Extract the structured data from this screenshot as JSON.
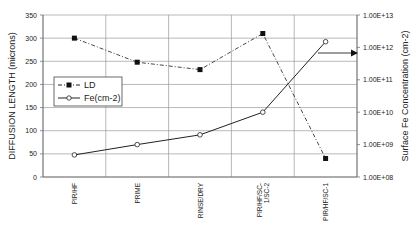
{
  "chart_data": {
    "type": "line",
    "title": "",
    "categories": [
      "PIR/HF",
      "PRIME",
      "RINSE/DRY",
      "PIR/HF/SC-1/SC-2",
      "PIR/HF/SC-1"
    ],
    "category_labels": [
      [
        "PIR/HF"
      ],
      [
        "PRIME"
      ],
      [
        "RINSE/DRY"
      ],
      [
        "PIR/HF/SC-",
        "1/SC-2"
      ],
      [
        "PIR/HF/SC-1"
      ]
    ],
    "xlabel": "",
    "ylabel": "DIFFUSION LENGTH (microns)",
    "ylim": [
      0,
      350
    ],
    "yticks": [
      0,
      50,
      100,
      150,
      200,
      250,
      300,
      350
    ],
    "y2label": "Surface Fe Concentration (cm-2)",
    "y2scale": "log",
    "y2lim": [
      100000000.0,
      10000000000000.0
    ],
    "y2ticks": [
      100000000.0,
      1000000000.0,
      10000000000.0,
      100000000000.0,
      1000000000000.0,
      10000000000000.0
    ],
    "y2ticklabels": [
      "1.00E+08",
      "1.00E+09",
      "1.00E+10",
      "1.00E+11",
      "1.00E+12",
      "1.00E+13"
    ],
    "grid": true,
    "legend_position": "center-left",
    "series": [
      {
        "name": "LD",
        "axis": "left",
        "style": "dash-dot",
        "marker": "filled-square",
        "values": [
          300,
          248,
          232,
          310,
          40
        ]
      },
      {
        "name": "Fe(cm-2)",
        "axis": "right",
        "style": "solid",
        "marker": "open-circle",
        "values": [
          480000000.0,
          1000000000.0,
          2000000000.0,
          10000000000.0,
          1500000000000.0
        ]
      }
    ],
    "annotations": [
      {
        "type": "arrow",
        "direction": "right",
        "points_to": "right-axis",
        "from_series": "Fe(cm-2)"
      }
    ]
  }
}
